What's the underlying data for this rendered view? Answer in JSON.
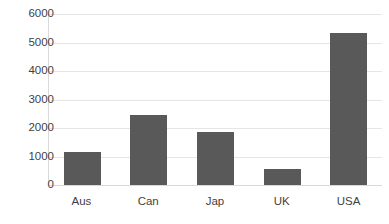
{
  "chart_data": {
    "type": "bar",
    "title": "",
    "subtitle": "",
    "xlabel": "",
    "ylabel": "",
    "categories": [
      "Aus",
      "Can",
      "Jap",
      "UK",
      "USA"
    ],
    "values": [
      1150,
      2450,
      1870,
      560,
      5350
    ],
    "ylim": [
      0,
      6000
    ],
    "yticks": [
      0,
      1000,
      2000,
      3000,
      4000,
      5000,
      6000
    ],
    "ytick_labels": [
      "0",
      "1000",
      "2000",
      "3000",
      "4000",
      "5000",
      "6000"
    ],
    "grid": "horizontal",
    "legend": "none",
    "bar_color": "#595959",
    "gridline_color": "#e6e6e6",
    "axis_color": "#d9d9d9",
    "background": "#ffffff",
    "series": [
      {
        "name": "",
        "values": [
          1150,
          2450,
          1870,
          560,
          5350
        ]
      }
    ]
  }
}
